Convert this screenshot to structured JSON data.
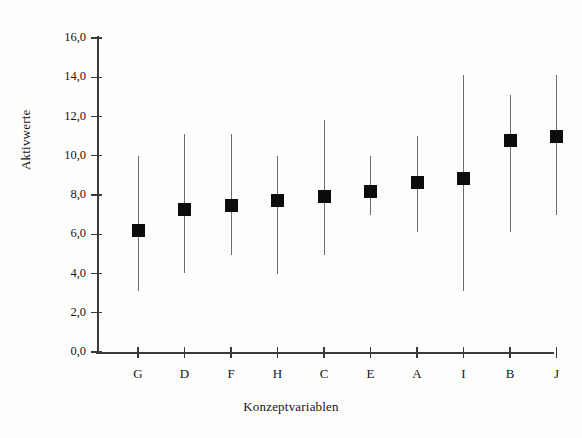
{
  "chart_data": {
    "type": "scatter",
    "title": "",
    "xlabel": "Konzeptvariablen",
    "ylabel": "Aktivwerte",
    "categories": [
      "G",
      "D",
      "F",
      "H",
      "C",
      "E",
      "A",
      "I",
      "B",
      "J"
    ],
    "values": [
      6.2,
      7.25,
      7.45,
      7.7,
      7.9,
      8.2,
      8.65,
      8.85,
      10.8,
      11.0
    ],
    "error_low": [
      3.1,
      4.0,
      4.95,
      4.0,
      4.95,
      7.0,
      6.1,
      3.1,
      6.1,
      7.0
    ],
    "error_high": [
      10.0,
      11.1,
      11.1,
      10.0,
      11.8,
      10.0,
      11.0,
      14.1,
      13.1,
      14.1
    ],
    "series": [
      {
        "name": "Aktivwerte",
        "points": [
          {
            "category": "G",
            "value": 6.2,
            "low": 3.1,
            "high": 10.0
          },
          {
            "category": "D",
            "value": 7.25,
            "low": 4.0,
            "high": 11.1
          },
          {
            "category": "F",
            "value": 7.45,
            "low": 4.95,
            "high": 11.1
          },
          {
            "category": "H",
            "value": 7.7,
            "low": 4.0,
            "high": 10.0
          },
          {
            "category": "C",
            "value": 7.9,
            "low": 4.95,
            "high": 11.8
          },
          {
            "category": "E",
            "value": 8.2,
            "low": 7.0,
            "high": 10.0
          },
          {
            "category": "A",
            "value": 8.65,
            "low": 6.1,
            "high": 11.0
          },
          {
            "category": "I",
            "value": 8.85,
            "low": 3.1,
            "high": 14.1
          },
          {
            "category": "B",
            "value": 10.8,
            "low": 6.1,
            "high": 13.1
          },
          {
            "category": "J",
            "value": 11.0,
            "low": 7.0,
            "high": 14.1
          }
        ]
      }
    ],
    "ylim": [
      0,
      16
    ],
    "ytick_values": [
      0,
      2,
      4,
      6,
      8,
      10,
      12,
      14,
      16
    ],
    "ytick_labels": [
      "0,0",
      "2,0",
      "4,0",
      "6,0",
      "8,0",
      "10,0",
      "12,0",
      "14,0",
      "16,0"
    ],
    "grid": false,
    "legend": false,
    "marker_color": "#0c0c0c",
    "whisker_color": "#6e6e6e",
    "axis_color": "#3a3a3a"
  }
}
